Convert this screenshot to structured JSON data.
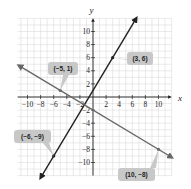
{
  "chart_data": {
    "type": "line",
    "title": "",
    "xlabel": "x",
    "ylabel": "y",
    "xlim": [
      -11.5,
      12
    ],
    "ylim": [
      -12,
      12
    ],
    "grid": true,
    "x_ticks": [
      -10,
      -8,
      -6,
      -4,
      -2,
      2,
      4,
      6,
      8,
      10
    ],
    "y_ticks": [
      -10,
      -8,
      -6,
      -4,
      -2,
      2,
      4,
      6,
      8,
      10
    ],
    "x_tick_labels": [
      "−10",
      "−8",
      "−6",
      "−4",
      "−2",
      "2",
      "4",
      "6",
      "8",
      "10"
    ],
    "y_tick_labels": [
      "−10",
      "−8",
      "−6",
      "−4",
      "−2",
      "2",
      "4",
      "6",
      "8",
      "10"
    ],
    "series": [
      {
        "name": "line through (-6, -9) and (3, 6)",
        "color": "#222222",
        "slope": 1.6667,
        "intercept": 1,
        "points": [
          {
            "x": -6,
            "y": -9
          },
          {
            "x": 3,
            "y": 6
          }
        ],
        "labels": [
          "(−6, −9)",
          "(3, 6)"
        ]
      },
      {
        "name": "line through (-5, 1) and (10, -8)",
        "color": "#666666",
        "slope": -0.6,
        "intercept": -2,
        "points": [
          {
            "x": -5,
            "y": 1
          },
          {
            "x": 10,
            "y": -8
          }
        ],
        "labels": [
          "(−5, 1)",
          "(10, −8)"
        ]
      }
    ]
  },
  "axes": {
    "x_name": "x",
    "y_name": "y"
  },
  "callouts": [
    {
      "text": "(3, 6)"
    },
    {
      "text": "(−5, 1)"
    },
    {
      "text": "(−6, −9)"
    },
    {
      "text": "(10, −8)"
    }
  ],
  "colors": {
    "grid": "#d4d4d4",
    "axis": "#222222",
    "callout_bg": "#c8c8c8"
  }
}
